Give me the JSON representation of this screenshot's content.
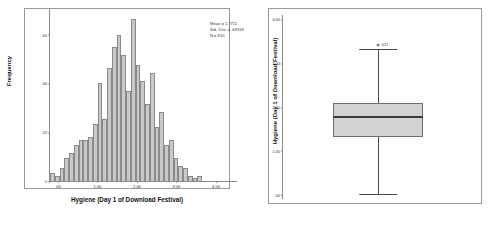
{
  "chart_data": [
    {
      "type": "bar",
      "title": "",
      "subtitle": "",
      "xlabel": "Hygiene (Day 1 of Download Festival)",
      "ylabel": "Frequency",
      "xlim": [
        -0.2,
        4.2
      ],
      "ylim": [
        0,
        65
      ],
      "grid": false,
      "legend": "none",
      "xticks": [
        ".00",
        "1.00",
        "2.00",
        "3.00",
        "4.00"
      ],
      "xtick_values": [
        0.0,
        1.0,
        2.0,
        3.0,
        4.0
      ],
      "yticks": [
        "0",
        "20",
        "40",
        "60"
      ],
      "ytick_values": [
        0,
        20,
        40,
        60
      ],
      "bin_width": 0.1,
      "categories": [
        "0.05",
        "0.15",
        "0.25",
        "0.35",
        "0.45",
        "0.55",
        "0.65",
        "0.75",
        "0.85",
        "0.95",
        "1.05",
        "1.15",
        "1.25",
        "1.35",
        "1.45",
        "1.55",
        "1.65",
        "1.75",
        "1.85",
        "1.95",
        "2.05",
        "2.15",
        "2.25",
        "2.35",
        "2.45",
        "2.55",
        "2.65",
        "2.75",
        "2.85",
        "2.95",
        "3.05",
        "3.15",
        "3.25",
        "3.35",
        "3.45",
        "3.55",
        "3.65"
      ],
      "values": [
        3,
        2,
        5,
        9,
        11,
        14,
        16,
        16,
        17,
        22,
        38,
        24,
        44,
        52,
        57,
        49,
        35,
        63,
        45,
        39,
        30,
        42,
        21,
        27,
        14,
        16,
        9,
        6,
        5,
        2,
        1,
        2,
        0,
        0,
        0,
        0,
        0
      ],
      "annotations": {
        "mean_label": "Mean = 1.7711",
        "std_dev_label": "Std. Dev. = .69318",
        "n_label": "N = 810",
        "mean": 1.7711,
        "std_dev": 0.69318,
        "n": 810
      }
    },
    {
      "type": "box",
      "title": "",
      "xlabel": "",
      "ylabel": "Hygiene (Day 1 of Download Festival)",
      "ylim": [
        -0.1,
        4.1
      ],
      "grid": false,
      "legend": "none",
      "yticks": [
        ".00",
        "1.00",
        "2.00",
        "3.00",
        "4.00"
      ],
      "ytick_values": [
        0.0,
        1.0,
        2.0,
        3.0,
        4.0
      ],
      "box": {
        "q1": 1.31,
        "median": 1.77,
        "q3": 2.08,
        "whisker_low": 0.02,
        "whisker_high": 3.32
      },
      "outliers": [
        {
          "value": 3.41,
          "label": "611"
        }
      ]
    }
  ],
  "histogram_panel": {
    "name": "Histogram",
    "xlabel": "Hygiene (Day 1 of Download Festival)",
    "ylabel": "Frequency",
    "stats": {
      "mean": "Mean = 1.7711",
      "std_dev": "Std. Dev. = .69318",
      "n": "N = 810"
    },
    "yticks": [
      "60",
      "40",
      "20",
      "0"
    ],
    "xticks": [
      ".00",
      "1.00",
      "2.00",
      "3.00",
      "4.00"
    ]
  },
  "boxplot_panel": {
    "name": "Boxplot",
    "ylabel": "Hygiene (Day 1 of Download Festival)",
    "yticks": [
      "4.00",
      "3.00",
      "2.00",
      "1.00",
      ".00"
    ],
    "outlier_label": "611"
  }
}
